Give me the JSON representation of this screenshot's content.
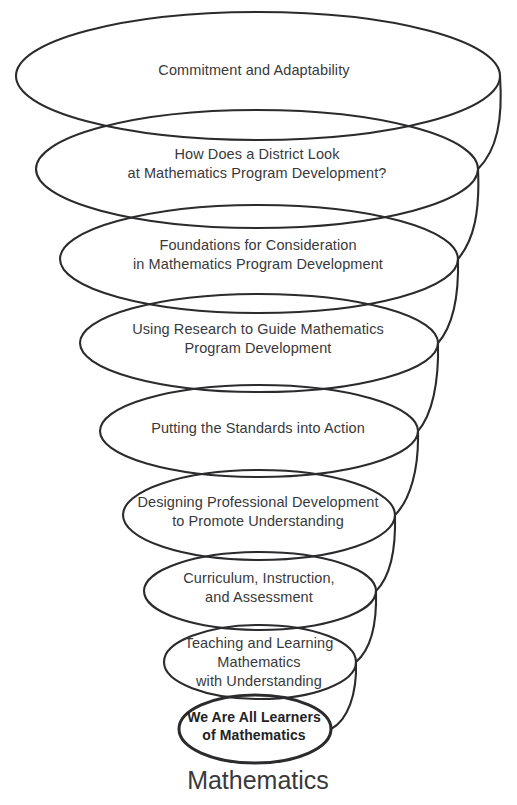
{
  "diagram": {
    "type": "spiral-funnel",
    "title_caption": "Mathematics",
    "stroke_color": "#2b2b2d",
    "text_color": "#39393b",
    "background_color": "#ffffff",
    "rings": [
      {
        "index": 1,
        "label": "Commitment and Adaptability",
        "bold": false,
        "cx": 258,
        "cy": 76,
        "rx": 242,
        "ry": 64,
        "text_x": 254,
        "text_y": 70,
        "stroke_width": 2.1
      },
      {
        "index": 2,
        "label": "How Does a District Look\nat Mathematics Program Development?",
        "bold": false,
        "cx": 257,
        "cy": 169,
        "rx": 221,
        "ry": 59,
        "text_x": 257,
        "text_y": 164,
        "stroke_width": 2.1
      },
      {
        "index": 3,
        "label": "Foundations for Consideration\nin Mathematics Program Development",
        "bold": false,
        "cx": 259,
        "cy": 259,
        "rx": 199,
        "ry": 54,
        "text_x": 258,
        "text_y": 255,
        "stroke_width": 2.1
      },
      {
        "index": 4,
        "label": "Using Research to Guide Mathematics\nProgram Development",
        "bold": false,
        "cx": 259,
        "cy": 343,
        "rx": 179,
        "ry": 49,
        "text_x": 258,
        "text_y": 339,
        "stroke_width": 2.1
      },
      {
        "index": 5,
        "label": "Putting the Standards into Action",
        "bold": false,
        "cx": 259,
        "cy": 431,
        "rx": 159,
        "ry": 46,
        "text_x": 258,
        "text_y": 428,
        "stroke_width": 2.1
      },
      {
        "index": 6,
        "label": "Designing Professional Development\nto Promote Understanding",
        "bold": false,
        "cx": 259,
        "cy": 515,
        "rx": 136,
        "ry": 45,
        "text_x": 258,
        "text_y": 512,
        "stroke_width": 2.1
      },
      {
        "index": 7,
        "label": "Curriculum, Instruction,\nand Assessment",
        "bold": false,
        "cx": 260,
        "cy": 591,
        "rx": 116,
        "ry": 39,
        "text_x": 259,
        "text_y": 588,
        "stroke_width": 2.1
      },
      {
        "index": 8,
        "label": "Teaching and Learning\nMathematics\nwith Understanding",
        "bold": false,
        "cx": 260,
        "cy": 662,
        "rx": 96,
        "ry": 37,
        "text_x": 259,
        "text_y": 662,
        "stroke_width": 2.1
      },
      {
        "index": 9,
        "label": "We Are All Learners\nof Mathematics",
        "bold": true,
        "cx": 255,
        "cy": 729,
        "rx": 76,
        "ry": 34,
        "text_x": 254,
        "text_y": 726,
        "stroke_width": 3.0
      }
    ],
    "connectors": [
      {
        "from_ring": 1,
        "to_ring": 2,
        "path": "M 500 76 C 503 120 497 150 478 169"
      },
      {
        "from_ring": 2,
        "to_ring": 3,
        "path": "M 478 169 C 480 212 474 240 458 259"
      },
      {
        "from_ring": 3,
        "to_ring": 4,
        "path": "M 458 259 C 459 300 452 327 438 343"
      },
      {
        "from_ring": 4,
        "to_ring": 5,
        "path": "M 438 343 C 439 383 432 415 418 431"
      },
      {
        "from_ring": 5,
        "to_ring": 6,
        "path": "M 418 431 C 419 470 410 500 395 515"
      },
      {
        "from_ring": 6,
        "to_ring": 7,
        "path": "M 395 515 C 396 552 389 578 376 591"
      },
      {
        "from_ring": 7,
        "to_ring": 8,
        "path": "M 376 591 C 377 625 370 650 356 662"
      },
      {
        "from_ring": 8,
        "to_ring": 9,
        "path": "M 356 662 C 357 694 348 720 331 729"
      }
    ]
  }
}
